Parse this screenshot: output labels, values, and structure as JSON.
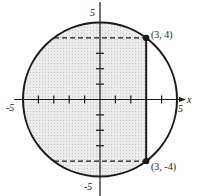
{
  "diagram": {
    "type": "circle-region",
    "circle": {
      "center": [
        0,
        0
      ],
      "radius": 5,
      "equation_hint": "x^2 + y^2 = 25"
    },
    "shaded_region": "interior of circle with x <= 3",
    "vertical_line": {
      "x": 3,
      "from": [
        3,
        -4
      ],
      "to": [
        3,
        4
      ]
    },
    "points": [
      {
        "label": "(3, 4)",
        "x": 3,
        "y": 4
      },
      {
        "label": "(3, -4)",
        "x": 3,
        "y": -4
      }
    ],
    "dashed_lines": [
      {
        "from": [
          -3,
          4
        ],
        "to": [
          3,
          4
        ]
      },
      {
        "from": [
          -3,
          -4
        ],
        "to": [
          3,
          -4
        ]
      }
    ],
    "axes": {
      "x_label": "x",
      "x_tick_labels": {
        "min": "-5",
        "max": "5"
      },
      "y_tick_labels": {
        "max": "5",
        "min": "-5"
      }
    },
    "colors": {
      "stroke": "#1a1a1a",
      "shade": "#e6e6e6",
      "background": "#ffffff"
    }
  }
}
